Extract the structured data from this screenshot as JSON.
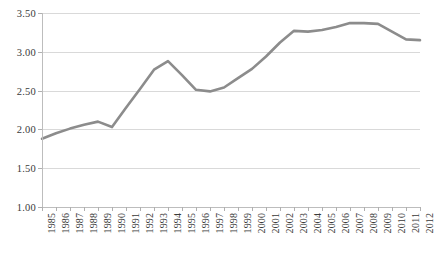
{
  "chart_data": {
    "type": "line",
    "title": "",
    "subtitle": "",
    "xlabel": "",
    "ylabel": "",
    "categories": [
      "1985",
      "1986",
      "1987",
      "1988",
      "1989",
      "1990",
      "1991",
      "1992",
      "1993",
      "1994",
      "1995",
      "1996",
      "1997",
      "1998",
      "1999",
      "2000",
      "2001",
      "2002",
      "2003",
      "2004",
      "2005",
      "2006",
      "2007",
      "2008",
      "2009",
      "2010",
      "2011",
      "2012"
    ],
    "series": [
      {
        "name": "series-1",
        "color": "#8c8c8c",
        "values": [
          1.88,
          1.95,
          2.01,
          2.06,
          2.1,
          2.03,
          2.28,
          2.52,
          2.77,
          2.88,
          2.7,
          2.51,
          2.49,
          2.54,
          2.66,
          2.78,
          2.94,
          3.12,
          3.27,
          3.26,
          3.28,
          3.32,
          3.37,
          3.37,
          3.36,
          3.26,
          3.16,
          3.15
        ]
      }
    ],
    "ylim": [
      1.0,
      3.5
    ],
    "ytick_values": [
      1.0,
      1.5,
      2.0,
      2.5,
      3.0,
      3.5
    ],
    "ytick_labels": [
      "1.00",
      "1.50",
      "2.00",
      "2.50",
      "3.00",
      "3.50"
    ],
    "grid": true,
    "grid_color": "#d9d9d9",
    "legend": false,
    "legend_position": "none",
    "background": "#ffffff",
    "axis_color": "#bdbdbd",
    "text_color": "#3a3a3a"
  }
}
